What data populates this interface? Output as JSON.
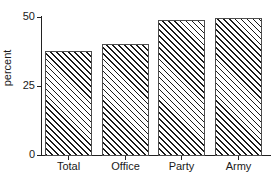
{
  "chart_data": {
    "type": "bar",
    "title": "",
    "subtitle": "",
    "xlabel": "",
    "ylabel": "percent",
    "categories": [
      "Total",
      "Office",
      "Party",
      "Army"
    ],
    "values": [
      37.7,
      40.2,
      48.9,
      49.5
    ],
    "ylim": [
      0,
      50
    ],
    "yticks": [
      0,
      25,
      50
    ],
    "ytick_labels": [
      "0",
      "25",
      "50"
    ],
    "grid": false,
    "legend": null,
    "series": [
      {
        "name": "percent",
        "values": [
          37.7,
          40.2,
          48.9,
          49.5
        ],
        "fill": "diagonal-hatch",
        "edge_color": "#4d4d4d",
        "hatch_color": "#1a1a1a",
        "face_color": "#ffffff"
      }
    ],
    "annotations": []
  },
  "axes": {
    "y_title": "percent",
    "ticks_y": [
      {
        "label": "50",
        "value": 50
      },
      {
        "label": "25",
        "value": 25
      },
      {
        "label": "0",
        "value": 0
      }
    ],
    "ticks_x": [
      {
        "label": "Total"
      },
      {
        "label": "Office"
      },
      {
        "label": "Party"
      },
      {
        "label": "Army"
      }
    ]
  },
  "colors": {
    "axis": "#222222",
    "text": "#1a1a1a",
    "bar_edge": "#4d4d4d",
    "bar_hatch": "#1a1a1a",
    "background": "#ffffff"
  }
}
